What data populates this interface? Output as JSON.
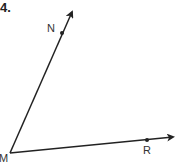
{
  "problem": {
    "number": "4."
  },
  "diagram": {
    "type": "angle",
    "vertex": {
      "label": "M",
      "x": 10,
      "y": 153
    },
    "rays": [
      {
        "name": "ray-MN",
        "point_label": "N",
        "point": {
          "x": 62,
          "y": 33
        },
        "tip": {
          "x": 73,
          "y": 10
        }
      },
      {
        "name": "ray-MR",
        "point_label": "R",
        "point": {
          "x": 147,
          "y": 140
        },
        "tip": {
          "x": 175,
          "y": 137
        }
      }
    ],
    "stroke_color": "#222222"
  }
}
